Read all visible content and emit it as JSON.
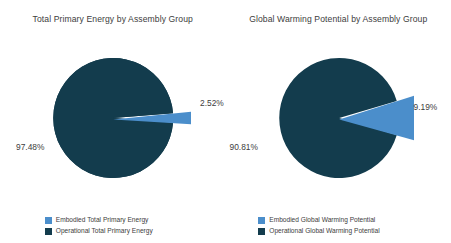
{
  "colors": {
    "embodied": "#4b8ecb",
    "operational": "#133c4d",
    "background": "#ffffff",
    "text": "#3d3d3d"
  },
  "panels": [
    {
      "title": "Total Primary Energy by Assembly Group",
      "major_label": "97.48%",
      "minor_label": "2.52%",
      "legend": [
        {
          "label": "Embodied Total Primary Energy",
          "color": "#4b8ecb"
        },
        {
          "label": "Operational Total Primary Energy",
          "color": "#133c4d"
        }
      ]
    },
    {
      "title": "Global Warming Potential by Assembly Group",
      "major_label": "90.81%",
      "minor_label": "9.19%",
      "legend": [
        {
          "label": "Embodied Global Warming Potential",
          "color": "#4b8ecb"
        },
        {
          "label": "Operational Global Warming Potential",
          "color": "#133c4d"
        }
      ]
    }
  ],
  "chart_data": [
    {
      "type": "pie",
      "title": "Total Primary Energy by Assembly Group",
      "categories": [
        "Embodied Total Primary Energy",
        "Operational Total Primary Energy"
      ],
      "values": [
        2.52,
        97.48
      ],
      "value_labels": [
        "2.52%",
        "97.48%"
      ],
      "colors": [
        "#4b8ecb",
        "#133c4d"
      ],
      "units": "percent",
      "exploded_slices": [
        "Embodied Total Primary Energy"
      ],
      "legend_position": "bottom",
      "grid": false
    },
    {
      "type": "pie",
      "title": "Global Warming Potential by Assembly Group",
      "categories": [
        "Embodied Global Warming Potential",
        "Operational Global Warming Potential"
      ],
      "values": [
        9.19,
        90.81
      ],
      "value_labels": [
        "9.19%",
        "90.81%"
      ],
      "colors": [
        "#4b8ecb",
        "#133c4d"
      ],
      "units": "percent",
      "exploded_slices": [
        "Embodied Global Warming Potential"
      ],
      "legend_position": "bottom",
      "grid": false
    }
  ]
}
